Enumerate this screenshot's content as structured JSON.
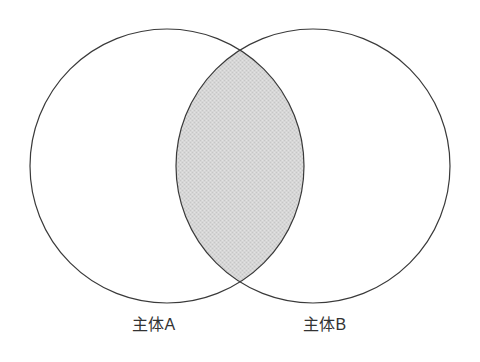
{
  "diagram": {
    "kind": "venn-diagram",
    "title_visible": false,
    "background_color": "#ffffff",
    "stroke_color": "#3a3a3a",
    "stroke_width": 1.2,
    "circle_fill": "#ffffff",
    "intersection_fill": "#d4d4d4",
    "intersection_pattern": "halftone-dither",
    "label_color": "#333333",
    "sets": [
      {
        "id": "set-a",
        "label": "主体A",
        "cx": 167,
        "cy": 166,
        "r": 137,
        "label_x": 132,
        "label_y": 316
      },
      {
        "id": "set-b",
        "label": "主体B",
        "cx": 313,
        "cy": 166,
        "r": 137,
        "label_x": 303,
        "label_y": 316
      }
    ],
    "intersection": {
      "id": "intersection-lens",
      "shaded": true,
      "left_x": 177,
      "right_x": 303,
      "top_y": 52,
      "bottom_y": 288
    }
  },
  "chart_data": {
    "type": "venn",
    "title": "",
    "xlabel": "",
    "ylabel": "",
    "categories": [
      "主体A",
      "主体B"
    ],
    "set_labels": [
      "主体A",
      "主体B"
    ],
    "highlighted_region": "A ∩ B",
    "regions": [
      {
        "name": "主体A only",
        "shaded": false,
        "fill": "#ffffff"
      },
      {
        "name": "主体B only",
        "shaded": false,
        "fill": "#ffffff"
      },
      {
        "name": "主体A ∩ 主体B",
        "shaded": true,
        "fill": "#d4d4d4"
      }
    ],
    "legend": [],
    "grid": false
  }
}
